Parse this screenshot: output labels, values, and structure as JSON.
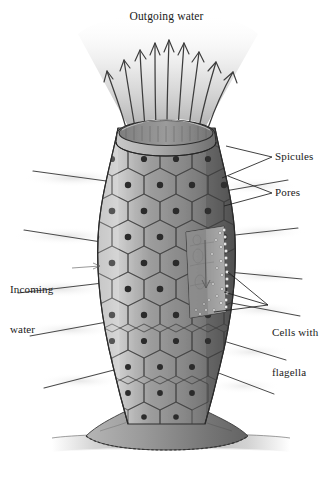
{
  "figure": {
    "title": "Outgoing water",
    "background_color": "#ffffff",
    "ink_color": "#1a1a1a",
    "body_color": "#8d8d8d",
    "body_shadow_color": "#5a5a5a",
    "body_highlight_color": "#c6c6c6",
    "plume_color": "#bdbdbd",
    "substrate_color": "#9a9a9a"
  },
  "labels": {
    "outgoing_water": "Outgoing water",
    "spicules": "Spicules",
    "pores": "Pores",
    "cells_with_flagella_line1": "Cells with",
    "cells_with_flagella_line2": "flagella",
    "incoming_water_line1": "Incoming",
    "incoming_water_line2": "water"
  },
  "diagram_data": {
    "type": "biological-illustration",
    "organism": "sponge",
    "view": "longitudinal cutaway",
    "parts": [
      {
        "name": "osculum",
        "description": "open rim at top of sponge body"
      },
      {
        "name": "spicules",
        "description": "needle-like skeletal projections radiating from body wall"
      },
      {
        "name": "pores",
        "description": "ostia; dark circular openings in each surface cell"
      },
      {
        "name": "cells with flagella",
        "description": "choanocytes lining the inner chamber"
      },
      {
        "name": "spongocoel",
        "description": "central internal chamber revealed by cutaway window"
      },
      {
        "name": "holdfast base",
        "description": "flared attachment to substrate"
      }
    ],
    "water_flow": [
      {
        "direction": "in",
        "label": "Incoming water",
        "through": "pores",
        "arrow_count": 0
      },
      {
        "direction": "out",
        "label": "Outgoing water",
        "through": "osculum",
        "arrow_count": 9
      }
    ],
    "outgoing_arrow_count": 9,
    "spicule_count_left": 5,
    "spicule_count_right": 6
  }
}
